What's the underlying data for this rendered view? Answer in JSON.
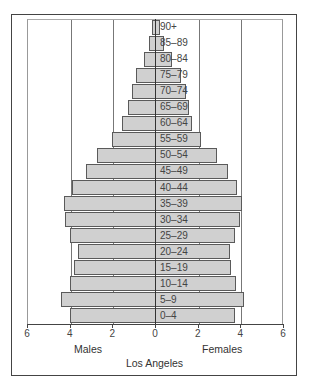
{
  "chart_data": {
    "type": "bar",
    "orientation": "horizontal",
    "subtype": "population-pyramid",
    "title": "Los Angeles",
    "xlabel_left": "Males",
    "xlabel_right": "Females",
    "x_ticks": [
      "6",
      "4",
      "2",
      "0",
      "2",
      "4",
      "6"
    ],
    "xlim": [
      -6,
      6
    ],
    "grid": true,
    "categories": [
      "90+",
      "85–89",
      "80–84",
      "75–79",
      "70–74",
      "65–69",
      "60–64",
      "55–59",
      "50–54",
      "45–49",
      "40–44",
      "35–39",
      "30–34",
      "25–29",
      "20–24",
      "15–19",
      "10–14",
      "5–9",
      "0–4"
    ],
    "series": [
      {
        "name": "Males",
        "values": [
          0.15,
          0.3,
          0.5,
          0.9,
          1.1,
          1.25,
          1.55,
          2.0,
          2.7,
          3.25,
          3.9,
          4.25,
          4.2,
          4.0,
          3.6,
          3.8,
          4.0,
          4.4,
          4.0
        ]
      },
      {
        "name": "Females",
        "values": [
          0.25,
          0.4,
          0.8,
          1.2,
          1.45,
          1.6,
          1.75,
          2.15,
          2.9,
          3.4,
          3.85,
          4.1,
          4.0,
          3.75,
          3.5,
          3.55,
          3.8,
          4.15,
          3.75
        ]
      }
    ]
  }
}
